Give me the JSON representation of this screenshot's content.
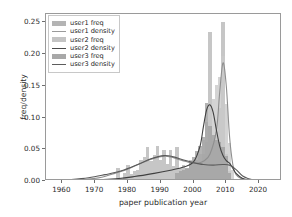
{
  "chart_data": {
    "type": "bar",
    "title": "",
    "xlabel": "paper publication year",
    "ylabel": "freq/density",
    "xlim": [
      1955,
      2027
    ],
    "ylim": [
      0.0,
      0.263
    ],
    "xticks": [
      1960,
      1970,
      1980,
      1990,
      2000,
      2010,
      2020
    ],
    "yticks": [
      0.0,
      0.05,
      0.1,
      0.15,
      0.2,
      0.25
    ],
    "ytick_labels": [
      "0.00",
      "0.05",
      "0.10",
      "0.15",
      "0.20",
      "0.25"
    ],
    "xtick_labels": [
      "1960",
      "1970",
      "1980",
      "1990",
      "2000",
      "2010",
      "2020"
    ],
    "grid": false,
    "legend_position": "upper left",
    "legend": [
      {
        "label": "user1 freq",
        "kind": "bar",
        "color": "#b4b4b4"
      },
      {
        "label": "user1 density",
        "kind": "line",
        "color": "#9a9a9a"
      },
      {
        "label": "user2 freq",
        "kind": "bar",
        "color": "#c4c4c4"
      },
      {
        "label": "user2 density",
        "kind": "line",
        "color": "#4a4a4a"
      },
      {
        "label": "user3 freq",
        "kind": "bar",
        "color": "#a8a8a8"
      },
      {
        "label": "user3 density",
        "kind": "line",
        "color": "#5c5c5c"
      }
    ],
    "series": [
      {
        "name": "user1 freq",
        "kind": "histogram",
        "color": "#b8b8b8",
        "bin_width": 1,
        "x": [
          1977,
          1979,
          1980,
          1981,
          1982,
          1983,
          1984,
          1985,
          1986,
          1987,
          1988,
          1989,
          1990,
          1991,
          1992,
          1993,
          1994,
          1995,
          1996,
          1997,
          1998,
          1999,
          2000,
          2001,
          2002,
          2003,
          2004,
          2005,
          2006,
          2007,
          2008,
          2009,
          2010,
          2011
        ],
        "y": [
          0.018,
          0.01,
          0.022,
          0.008,
          0.012,
          0.014,
          0.03,
          0.034,
          0.05,
          0.028,
          0.038,
          0.052,
          0.03,
          0.046,
          0.024,
          0.046,
          0.02,
          0.05,
          0.018,
          0.022,
          0.016,
          0.03,
          0.024,
          0.03,
          0.026,
          0.04,
          0.058,
          0.232,
          0.06,
          0.074,
          0.112,
          0.248,
          0.04,
          0.012
        ]
      },
      {
        "name": "user2 freq",
        "kind": "histogram",
        "color": "#c9c9c9",
        "bin_width": 1,
        "x": [
          1999,
          2000,
          2001,
          2002,
          2003,
          2004,
          2005,
          2006,
          2007,
          2008,
          2009,
          2010,
          2011,
          2012
        ],
        "y": [
          0.012,
          0.02,
          0.03,
          0.04,
          0.062,
          0.09,
          0.118,
          0.126,
          0.148,
          0.16,
          0.193,
          0.118,
          0.056,
          0.014
        ]
      },
      {
        "name": "user3 freq",
        "kind": "histogram",
        "color": "#a0a0a0",
        "bin_width": 1,
        "x": [
          1995,
          1996,
          1997,
          1998,
          1999,
          2000,
          2001,
          2002,
          2003,
          2004,
          2005,
          2006,
          2007,
          2008,
          2009,
          2010,
          2011
        ],
        "y": [
          0.01,
          0.012,
          0.014,
          0.018,
          0.026,
          0.034,
          0.044,
          0.052,
          0.066,
          0.12,
          0.084,
          0.07,
          0.062,
          0.058,
          0.05,
          0.036,
          0.01
        ]
      },
      {
        "name": "user1 density",
        "kind": "kde",
        "color": "#8e8e8e",
        "points": [
          [
            1955,
            0.0
          ],
          [
            1962,
            0.001
          ],
          [
            1968,
            0.003
          ],
          [
            1972,
            0.006
          ],
          [
            1976,
            0.012
          ],
          [
            1980,
            0.019
          ],
          [
            1984,
            0.028
          ],
          [
            1988,
            0.036
          ],
          [
            1991,
            0.039
          ],
          [
            1993,
            0.038
          ],
          [
            1996,
            0.033
          ],
          [
            1999,
            0.029
          ],
          [
            2001,
            0.028
          ],
          [
            2003,
            0.031
          ],
          [
            2005,
            0.042
          ],
          [
            2007,
            0.08
          ],
          [
            2008,
            0.14
          ],
          [
            2009,
            0.186
          ],
          [
            2010,
            0.15
          ],
          [
            2011,
            0.07
          ],
          [
            2012,
            0.026
          ],
          [
            2013,
            0.01
          ],
          [
            2015,
            0.003
          ],
          [
            2019,
            0.001
          ],
          [
            2027,
            0.0
          ]
        ]
      },
      {
        "name": "user2 density",
        "kind": "kde",
        "color": "#404040",
        "points": [
          [
            1955,
            0.0
          ],
          [
            1965,
            0.001
          ],
          [
            1975,
            0.003
          ],
          [
            1982,
            0.007
          ],
          [
            1988,
            0.012
          ],
          [
            1993,
            0.017
          ],
          [
            1997,
            0.022
          ],
          [
            2000,
            0.03
          ],
          [
            2002,
            0.055
          ],
          [
            2003,
            0.085
          ],
          [
            2004,
            0.112
          ],
          [
            2005,
            0.12
          ],
          [
            2006,
            0.108
          ],
          [
            2007,
            0.08
          ],
          [
            2008,
            0.055
          ],
          [
            2009,
            0.04
          ],
          [
            2010,
            0.032
          ],
          [
            2011,
            0.028
          ],
          [
            2012,
            0.02
          ],
          [
            2013,
            0.012
          ],
          [
            2015,
            0.004
          ],
          [
            2018,
            0.001
          ],
          [
            2027,
            0.0
          ]
        ]
      },
      {
        "name": "user3 density",
        "kind": "kde",
        "color": "#5a5a5a",
        "points": [
          [
            1955,
            0.0
          ],
          [
            1962,
            0.002
          ],
          [
            1968,
            0.005
          ],
          [
            1973,
            0.01
          ],
          [
            1978,
            0.016
          ],
          [
            1983,
            0.026
          ],
          [
            1987,
            0.035
          ],
          [
            1991,
            0.04
          ],
          [
            1994,
            0.038
          ],
          [
            1997,
            0.033
          ],
          [
            2000,
            0.029
          ],
          [
            2003,
            0.026
          ],
          [
            2006,
            0.025
          ],
          [
            2009,
            0.026
          ],
          [
            2011,
            0.025
          ],
          [
            2013,
            0.018
          ],
          [
            2015,
            0.008
          ],
          [
            2018,
            0.002
          ],
          [
            2022,
            0.0
          ],
          [
            2027,
            0.0
          ]
        ]
      }
    ]
  }
}
